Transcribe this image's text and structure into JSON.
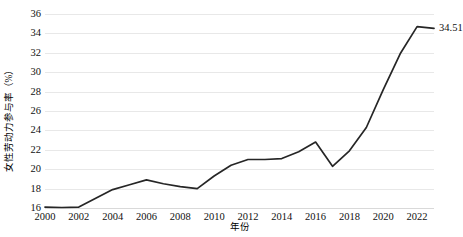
{
  "chart_data": {
    "type": "line",
    "title": "",
    "xlabel": "年份",
    "ylabel": "女性劳动力参与率（%）",
    "xlim": [
      2000,
      2023
    ],
    "ylim": [
      16,
      36
    ],
    "grid": true,
    "legend": "none",
    "y_ticks": [
      16,
      18,
      20,
      22,
      24,
      26,
      28,
      30,
      32,
      34,
      36
    ],
    "x_ticks": [
      2000,
      2002,
      2004,
      2006,
      2008,
      2010,
      2012,
      2014,
      2016,
      2018,
      2020,
      2022
    ],
    "x": [
      2000,
      2001,
      2002,
      2003,
      2004,
      2005,
      2006,
      2007,
      2008,
      2009,
      2010,
      2011,
      2012,
      2013,
      2014,
      2015,
      2016,
      2017,
      2018,
      2019,
      2020,
      2021,
      2022,
      2023
    ],
    "series": [
      {
        "name": "女性劳动力参与率",
        "color": "#262626",
        "values": [
          16.1,
          16.05,
          16.1,
          17.0,
          17.9,
          18.4,
          18.9,
          18.5,
          18.2,
          18.0,
          19.3,
          20.4,
          21.0,
          21.0,
          21.1,
          21.8,
          22.8,
          20.3,
          21.9,
          24.3,
          28.2,
          31.9,
          34.7,
          34.51
        ]
      }
    ],
    "annotations": [
      {
        "name": "end-value-label",
        "text": "34.51",
        "x": 2023,
        "y": 34.51
      }
    ]
  }
}
